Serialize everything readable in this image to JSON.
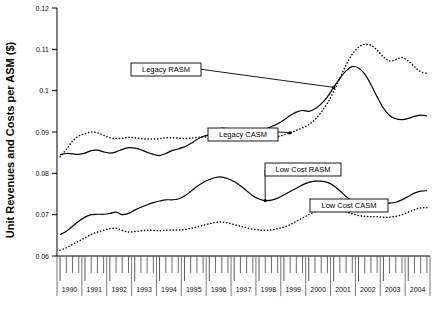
{
  "chart_data": {
    "type": "line",
    "title": "",
    "xlabel": "",
    "ylabel": "Unit Revenues and Costs per ASM ($)",
    "ylim": [
      0.06,
      0.12
    ],
    "ytick_labels": [
      "0.06",
      "0.07",
      "0.08",
      "0.09",
      "0.1",
      "0.11",
      "0.12"
    ],
    "ytick_values": [
      0.06,
      0.07,
      0.08,
      0.09,
      0.1,
      0.11,
      0.12
    ],
    "grid": false,
    "legend_position": "inline-annotations",
    "x_axis_note": "quarterly ticks, year labels centered",
    "xtick_labels": [
      "1990",
      "1991",
      "1992",
      "1993",
      "1994",
      "1995",
      "1996",
      "1997",
      "1998",
      "1999",
      "2000",
      "2001",
      "2002",
      "2003",
      "2004"
    ],
    "x": [
      "1990Q1",
      "1990Q2",
      "1990Q3",
      "1990Q4",
      "1991Q1",
      "1991Q2",
      "1991Q3",
      "1991Q4",
      "1992Q1",
      "1992Q2",
      "1992Q3",
      "1992Q4",
      "1993Q1",
      "1993Q2",
      "1993Q3",
      "1993Q4",
      "1994Q1",
      "1994Q2",
      "1994Q3",
      "1994Q4",
      "1995Q1",
      "1995Q2",
      "1995Q3",
      "1995Q4",
      "1996Q1",
      "1996Q2",
      "1996Q3",
      "1996Q4",
      "1997Q1",
      "1997Q2",
      "1997Q3",
      "1997Q4",
      "1998Q1",
      "1998Q2",
      "1998Q3",
      "1998Q4",
      "1999Q1",
      "1999Q2",
      "1999Q3",
      "1999Q4",
      "2000Q1",
      "2000Q2",
      "2000Q3",
      "2000Q4",
      "2001Q1",
      "2001Q2",
      "2001Q3",
      "2001Q4",
      "2002Q1",
      "2002Q2",
      "2002Q3",
      "2002Q4",
      "2003Q1",
      "2003Q2",
      "2003Q3",
      "2003Q4",
      "2004Q1",
      "2004Q2",
      "2004Q3",
      "2004Q4"
    ],
    "series": [
      {
        "name": "Legacy RASM",
        "style": "solid",
        "color": "#000000",
        "values": [
          0.0845,
          0.0848,
          0.0847,
          0.0846,
          0.0849,
          0.0855,
          0.0856,
          0.0852,
          0.0849,
          0.0852,
          0.0858,
          0.0862,
          0.0861,
          0.0857,
          0.0851,
          0.0846,
          0.0843,
          0.0848,
          0.0855,
          0.0859,
          0.0864,
          0.0872,
          0.0882,
          0.0889,
          0.0893,
          0.0897,
          0.0898,
          0.0896,
          0.0898,
          0.0903,
          0.0906,
          0.0905,
          0.0903,
          0.0907,
          0.0913,
          0.092,
          0.0929,
          0.094,
          0.0948,
          0.0952,
          0.095,
          0.0956,
          0.0968,
          0.0985,
          0.1008,
          0.103,
          0.1048,
          0.1058,
          0.1055,
          0.104,
          0.1015,
          0.0985,
          0.0958,
          0.094,
          0.0932,
          0.093,
          0.0933,
          0.0938,
          0.0941,
          0.0939
        ]
      },
      {
        "name": "Legacy CASM",
        "style": "dotted",
        "color": "#000000",
        "values": [
          0.084,
          0.0858,
          0.0878,
          0.089,
          0.0896,
          0.09,
          0.0898,
          0.0892,
          0.0886,
          0.0884,
          0.0885,
          0.0887,
          0.0886,
          0.0884,
          0.0883,
          0.0883,
          0.0884,
          0.0886,
          0.0886,
          0.0885,
          0.0884,
          0.0885,
          0.0887,
          0.0888,
          0.0888,
          0.0889,
          0.089,
          0.0889,
          0.0887,
          0.0886,
          0.0885,
          0.0884,
          0.0883,
          0.0884,
          0.0886,
          0.0889,
          0.0893,
          0.0898,
          0.0904,
          0.091,
          0.0918,
          0.093,
          0.0948,
          0.097,
          0.0998,
          0.103,
          0.1062,
          0.1088,
          0.1105,
          0.1112,
          0.111,
          0.1098,
          0.1082,
          0.1072,
          0.1075,
          0.108,
          0.1072,
          0.1058,
          0.1046,
          0.1042
        ]
      },
      {
        "name": "Low Cost RASM",
        "style": "solid",
        "color": "#000000",
        "values": [
          0.0652,
          0.066,
          0.0672,
          0.0684,
          0.0694,
          0.07,
          0.0701,
          0.0701,
          0.0703,
          0.0706,
          0.07,
          0.0703,
          0.0711,
          0.0718,
          0.0724,
          0.0729,
          0.0733,
          0.0736,
          0.0736,
          0.0738,
          0.0745,
          0.0756,
          0.0768,
          0.0778,
          0.0785,
          0.079,
          0.0791,
          0.0787,
          0.078,
          0.077,
          0.0758,
          0.0746,
          0.0738,
          0.0734,
          0.0735,
          0.074,
          0.0748,
          0.0756,
          0.0764,
          0.0772,
          0.0778,
          0.0781,
          0.0781,
          0.0778,
          0.077,
          0.0758,
          0.0744,
          0.0732,
          0.0724,
          0.0722,
          0.0724,
          0.0727,
          0.0728,
          0.0728,
          0.073,
          0.0736,
          0.0744,
          0.0752,
          0.0757,
          0.0758
        ]
      },
      {
        "name": "Low Cost CASM",
        "style": "dotted",
        "color": "#000000",
        "values": [
          0.0614,
          0.062,
          0.0628,
          0.0636,
          0.0644,
          0.0652,
          0.0658,
          0.0662,
          0.0666,
          0.0667,
          0.0662,
          0.0658,
          0.0659,
          0.0661,
          0.0662,
          0.0662,
          0.0661,
          0.0662,
          0.0663,
          0.0663,
          0.0664,
          0.0667,
          0.067,
          0.0674,
          0.0678,
          0.0681,
          0.0682,
          0.068,
          0.0676,
          0.0672,
          0.0668,
          0.0665,
          0.0663,
          0.0662,
          0.0663,
          0.0666,
          0.067,
          0.0676,
          0.0684,
          0.0692,
          0.07,
          0.0707,
          0.0712,
          0.0715,
          0.0715,
          0.0712,
          0.0707,
          0.0702,
          0.0698,
          0.0696,
          0.0695,
          0.0695,
          0.0694,
          0.0694,
          0.0696,
          0.07,
          0.0706,
          0.0712,
          0.0716,
          0.0717
        ]
      }
    ],
    "annotations": [
      {
        "label": "Legacy RASM",
        "target_series": "Legacy RASM"
      },
      {
        "label": "Legacy CASM",
        "target_series": "Legacy CASM"
      },
      {
        "label": "Low Cost RASM",
        "target_series": "Low Cost RASM"
      },
      {
        "label": "Low Cost CASM",
        "target_series": "Low Cost CASM"
      }
    ]
  }
}
